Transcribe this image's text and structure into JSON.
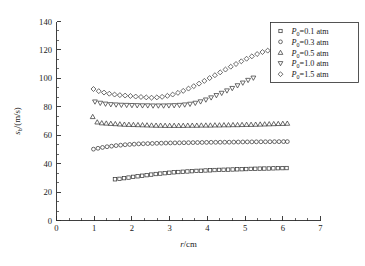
{
  "figure": {
    "background_color": "#ffffff",
    "marker_color": "#3a3a3a",
    "axis_color": "#2a2a2a"
  },
  "chart_data": {
    "type": "scatter",
    "title": "",
    "xlabel": "r/cm",
    "xlabel_italic_part": "r",
    "xlabel_rest": "/cm",
    "ylabel": "s_b/(m/s)",
    "ylabel_italic_part": "s",
    "ylabel_sub": "b",
    "ylabel_rest": "/(m/s)",
    "xlim": [
      0,
      7
    ],
    "ylim": [
      0,
      140
    ],
    "xticks": [
      0,
      1,
      2,
      3,
      4,
      5,
      6,
      7
    ],
    "xtick_labels": [
      "0",
      "1",
      "2",
      "3",
      "4",
      "5",
      "6",
      "7"
    ],
    "yticks": [
      0,
      20,
      40,
      60,
      80,
      100,
      120,
      140
    ],
    "ytick_labels": [
      "0",
      "20",
      "40",
      "60",
      "80",
      "100",
      "120",
      "140"
    ],
    "x_minor_per_major": 2,
    "y_minor_per_major": 2,
    "grid": false,
    "legend_position": "top-right",
    "series": [
      {
        "name": "P_0=0.1 atm",
        "legend_label_prefix": "P",
        "legend_label_sub": "0",
        "legend_label_rest": "=0.1 atm",
        "marker": "square",
        "x": [
          1.55,
          1.67,
          1.79,
          1.91,
          2.03,
          2.15,
          2.27,
          2.39,
          2.51,
          2.63,
          2.75,
          2.87,
          2.99,
          3.11,
          3.23,
          3.35,
          3.47,
          3.59,
          3.71,
          3.83,
          3.95,
          4.07,
          4.19,
          4.31,
          4.43,
          4.55,
          4.67,
          4.79,
          4.91,
          5.03,
          5.15,
          5.27,
          5.39,
          5.51,
          5.63,
          5.75,
          5.87,
          5.99,
          6.1
        ],
        "y": [
          29.0,
          29.3,
          29.8,
          30.2,
          30.7,
          31.1,
          31.5,
          31.9,
          32.3,
          32.7,
          33.0,
          33.3,
          33.6,
          33.9,
          34.1,
          34.3,
          34.5,
          34.7,
          34.9,
          35.0,
          35.2,
          35.3,
          35.5,
          35.6,
          35.7,
          35.8,
          35.9,
          36.0,
          36.1,
          36.2,
          36.3,
          36.4,
          36.5,
          36.55,
          36.6,
          36.7,
          36.8,
          36.85,
          36.9
        ]
      },
      {
        "name": "P_0=0.3 atm",
        "legend_label_prefix": "P",
        "legend_label_sub": "0",
        "legend_label_rest": "=0.3 atm",
        "marker": "circle",
        "x": [
          0.98,
          1.1,
          1.22,
          1.34,
          1.46,
          1.58,
          1.7,
          1.82,
          1.94,
          2.06,
          2.18,
          2.3,
          2.42,
          2.54,
          2.66,
          2.78,
          2.9,
          3.02,
          3.14,
          3.26,
          3.38,
          3.5,
          3.62,
          3.74,
          3.86,
          3.98,
          4.1,
          4.22,
          4.34,
          4.46,
          4.58,
          4.7,
          4.82,
          4.94,
          5.06,
          5.18,
          5.3,
          5.42,
          5.54,
          5.66,
          5.78,
          5.9,
          6.02,
          6.12
        ],
        "y": [
          50.2,
          50.8,
          51.4,
          51.9,
          52.3,
          52.7,
          53.0,
          53.3,
          53.5,
          53.7,
          53.9,
          54.0,
          54.1,
          54.2,
          54.3,
          54.4,
          54.5,
          54.55,
          54.6,
          54.65,
          54.7,
          54.75,
          54.8,
          54.85,
          54.9,
          54.95,
          55.0,
          55.02,
          55.05,
          55.08,
          55.1,
          55.15,
          55.2,
          55.25,
          55.3,
          55.32,
          55.35,
          55.38,
          55.4,
          55.42,
          55.45,
          55.48,
          55.5,
          55.5
        ]
      },
      {
        "name": "P_0=0.5 atm",
        "legend_label_prefix": "P",
        "legend_label_sub": "0",
        "legend_label_rest": "=0.5 atm",
        "marker": "triangle-up",
        "x": [
          0.96,
          1.08,
          1.2,
          1.32,
          1.44,
          1.56,
          1.68,
          1.8,
          1.92,
          2.04,
          2.16,
          2.28,
          2.4,
          2.52,
          2.64,
          2.76,
          2.88,
          3.0,
          3.12,
          3.24,
          3.36,
          3.48,
          3.6,
          3.72,
          3.84,
          3.96,
          4.08,
          4.2,
          4.32,
          4.44,
          4.56,
          4.68,
          4.8,
          4.92,
          5.04,
          5.16,
          5.28,
          5.4,
          5.52,
          5.64,
          5.76,
          5.88,
          6.0,
          6.12
        ],
        "y": [
          73.0,
          69.2,
          68.6,
          68.4,
          68.2,
          68.0,
          67.8,
          67.6,
          67.5,
          67.4,
          67.3,
          67.2,
          67.1,
          67.0,
          66.9,
          66.9,
          66.8,
          66.8,
          66.8,
          66.8,
          66.8,
          66.9,
          66.9,
          66.9,
          67.0,
          67.0,
          67.0,
          67.1,
          67.1,
          67.2,
          67.2,
          67.3,
          67.3,
          67.4,
          67.5,
          67.5,
          67.6,
          67.7,
          67.8,
          67.9,
          68.0,
          68.1,
          68.2,
          68.3
        ]
      },
      {
        "name": "P_0=1.0 atm",
        "legend_label_prefix": "P",
        "legend_label_sub": "0",
        "legend_label_rest": "=1.0 atm",
        "marker": "triangle-down",
        "x": [
          1.02,
          1.16,
          1.3,
          1.44,
          1.58,
          1.72,
          1.86,
          2.0,
          2.14,
          2.28,
          2.42,
          2.56,
          2.7,
          2.84,
          2.98,
          3.12,
          3.26,
          3.4,
          3.54,
          3.68,
          3.82,
          3.96,
          4.1,
          4.24,
          4.38,
          4.52,
          4.66,
          4.8,
          4.94,
          5.08,
          5.22
        ],
        "y": [
          83.5,
          82.6,
          82.0,
          81.6,
          81.4,
          81.2,
          81.1,
          81.0,
          80.9,
          80.8,
          80.8,
          80.7,
          80.7,
          80.7,
          80.8,
          80.9,
          81.1,
          81.4,
          81.9,
          82.6,
          83.6,
          84.9,
          86.4,
          88.0,
          89.6,
          91.3,
          93.0,
          94.9,
          96.8,
          98.7,
          100.3
        ]
      },
      {
        "name": "P_0=1.5 atm",
        "legend_label_prefix": "P",
        "legend_label_sub": "0",
        "legend_label_rest": "=1.5 atm",
        "marker": "diamond",
        "x": [
          0.98,
          1.12,
          1.26,
          1.4,
          1.54,
          1.68,
          1.82,
          1.96,
          2.1,
          2.24,
          2.38,
          2.52,
          2.66,
          2.8,
          2.94,
          3.08,
          3.22,
          3.36,
          3.5,
          3.64,
          3.78,
          3.92,
          4.06,
          4.2,
          4.34,
          4.48,
          4.62,
          4.76,
          4.9,
          5.04,
          5.18,
          5.32,
          5.46,
          5.6,
          5.74,
          5.85
        ],
        "y": [
          92.5,
          91.0,
          90.0,
          89.2,
          88.6,
          88.2,
          87.9,
          87.6,
          87.2,
          86.9,
          86.6,
          86.4,
          86.6,
          87.0,
          87.7,
          88.6,
          89.8,
          91.2,
          92.8,
          94.5,
          96.3,
          98.2,
          100.2,
          102.2,
          104.2,
          106.2,
          108.2,
          110.1,
          112.0,
          113.8,
          115.5,
          117.1,
          118.5,
          119.5,
          120.3,
          120.6
        ]
      }
    ]
  }
}
